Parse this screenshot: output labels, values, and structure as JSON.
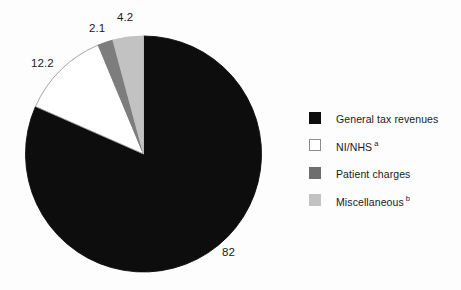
{
  "chart_data": {
    "type": "pie",
    "title": "",
    "subtitle": "",
    "xlabel": "",
    "ylabel": "",
    "legend_position": "right",
    "grid": false,
    "categories": [
      "General tax revenues",
      "NI/NHS",
      "Patient charges",
      "Miscellaneous"
    ],
    "values": [
      82,
      12.2,
      2.1,
      4.2
    ],
    "labels": [
      "82",
      "12.2",
      "2.1",
      "4.2"
    ],
    "footnote_markers": [
      "",
      "a",
      "a_none",
      "b"
    ],
    "slices": [
      {
        "name": "General tax revenues",
        "value": 82,
        "label": "82",
        "footnote": "",
        "color": "#0d0d0d",
        "stroke": "#0d0d0d"
      },
      {
        "name": "NI/NHS",
        "value": 12.2,
        "label": "12.2",
        "footnote": "a",
        "color": "#ffffff",
        "stroke": "#9a9a9a"
      },
      {
        "name": "Patient charges",
        "value": 2.1,
        "label": "2.1",
        "footnote": "",
        "color": "#7d7d7d",
        "stroke": "#7d7d7d"
      },
      {
        "name": "Miscellaneous",
        "value": 4.2,
        "label": "4.2",
        "footnote": "b",
        "color": "#c2c2c2",
        "stroke": "#c2c2c2"
      }
    ]
  },
  "legend": {
    "items": [
      {
        "label": "General tax revenues",
        "footnote": "",
        "color": "#0d0d0d",
        "border": "#0d0d0d"
      },
      {
        "label": "NI/NHS",
        "footnote": "a",
        "color": "#ffffff",
        "border": "#8c8c8c"
      },
      {
        "label": "Patient charges",
        "footnote": "",
        "color": "#6e6e6e",
        "border": "#6e6e6e"
      },
      {
        "label": "Miscellaneous",
        "footnote": "b",
        "color": "#c2c2c2",
        "border": "#c2c2c2"
      }
    ]
  },
  "geometry": {
    "cx": 143.5,
    "cy": 154,
    "r": 118
  },
  "colors": {
    "background": "#fdfdfd",
    "text": "#1a1a1a"
  }
}
